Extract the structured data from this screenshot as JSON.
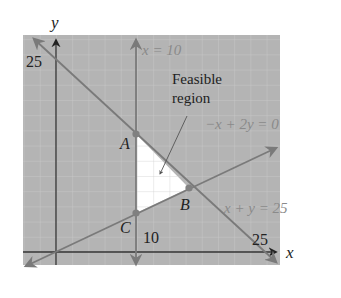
{
  "diagram": {
    "type": "linear-programming-feasible-region",
    "axes": {
      "x_label": "x",
      "y_label": "y",
      "x_tick": "25",
      "y_tick": "25",
      "x10_tick": "10"
    },
    "lines": [
      {
        "id": "vertical",
        "label": "x = 10"
      },
      {
        "id": "diag_up",
        "label": "−x + 2y = 0"
      },
      {
        "id": "diag_down",
        "label": "x + y = 25"
      }
    ],
    "points": [
      {
        "name": "A",
        "coords": [
          10,
          15
        ]
      },
      {
        "name": "B",
        "coords": [
          16.67,
          8.33
        ]
      },
      {
        "name": "C",
        "coords": [
          10,
          5
        ]
      }
    ],
    "region_label_line1": "Feasible",
    "region_label_line2": "region",
    "colors": {
      "background_shade": "#b4b4b4",
      "grid": "#c8c8c8",
      "constraint_lines": "#7a7a7a",
      "axes": "#333333",
      "feasible_fill": "#ffffff",
      "point": "#808080",
      "label_gray": "#8a8a8a",
      "label_dark": "#222222"
    }
  }
}
